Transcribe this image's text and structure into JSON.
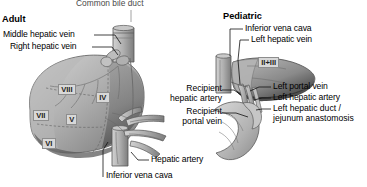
{
  "figure": {
    "top_caption": "Common bile duct",
    "panels": [
      {
        "id": "adult",
        "title": "Adult"
      },
      {
        "id": "pediatric",
        "title": "Pediatric"
      }
    ]
  },
  "adult": {
    "title": "Adult",
    "labels": [
      {
        "name": "middle-hepatic-vein",
        "text": "Middle hepatic vein"
      },
      {
        "name": "right-hepatic-vein",
        "text": "Right hepatic vein"
      },
      {
        "name": "hepatic-artery",
        "text": "Hepatic artery"
      },
      {
        "name": "inferior-vena-cava",
        "text": "Inferior vena cava"
      }
    ],
    "segments": [
      {
        "name": "segment-viii",
        "text": "VIII"
      },
      {
        "name": "segment-iv",
        "text": "IV"
      },
      {
        "name": "segment-vii",
        "text": "VII"
      },
      {
        "name": "segment-v",
        "text": "V"
      },
      {
        "name": "segment-vi",
        "text": "VI"
      }
    ]
  },
  "center": {
    "recipient_hepatic_artery": "Recipient\nhepatic artery",
    "recipient_portal_vein": "Recipient\nportal vein"
  },
  "pediatric": {
    "title": "Pediatric",
    "labels": [
      {
        "name": "inferior-vena-cava",
        "text": "Inferior vena cava"
      },
      {
        "name": "left-hepatic-vein",
        "text": "Left hepatic vein"
      },
      {
        "name": "left-portal-vein",
        "text": "Left portal vein"
      },
      {
        "name": "left-hepatic-artery",
        "text": "Left hepatic artery"
      },
      {
        "name": "left-hepatic-duct-jejunum-anastomosis",
        "text": "Left hepatic duct /\njejunum anastomosis"
      }
    ],
    "segments": [
      {
        "name": "segment-ii-iii",
        "text": "II+III"
      }
    ]
  },
  "colors": {
    "background": "#ffffff",
    "text": "#000000",
    "caption_gray": "#4a4a4a",
    "liver_light": "#c9c9c9",
    "liver_mid": "#a8a8a8",
    "liver_dark": "#6f6f6f",
    "liver_darkest": "#3d3d3d",
    "vessel_fill": "#b5b5b5",
    "vessel_line": "#5a5a5a",
    "segment_box": "#d8d8d8",
    "leader_line": "#111111"
  }
}
